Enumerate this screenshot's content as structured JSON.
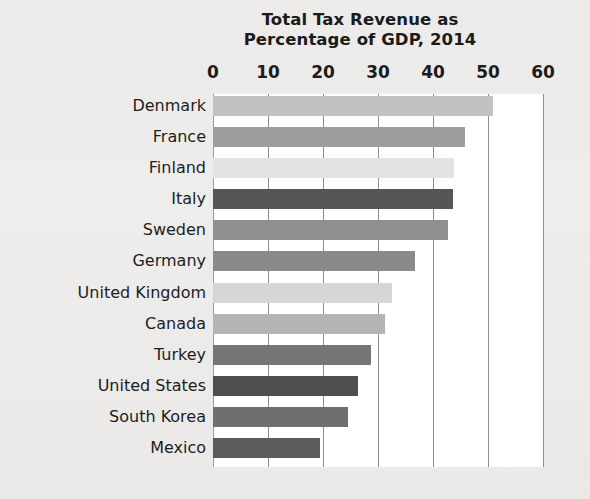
{
  "chart_data": {
    "type": "bar",
    "orientation": "horizontal",
    "title": "Total Tax Revenue as Percentage of GDP, 2014",
    "title_lines": [
      "Total Tax Revenue as",
      "Percentage of GDP, 2014"
    ],
    "xlabel": "",
    "ylabel": "",
    "xlim": [
      0,
      60
    ],
    "xticks": [
      0,
      10,
      20,
      30,
      40,
      50,
      60
    ],
    "xtick_labels": [
      "0",
      "10",
      "20",
      "30",
      "40",
      "50",
      "60"
    ],
    "grid": "vertical",
    "legend": "none",
    "units": "percent of GDP",
    "categories": [
      "Denmark",
      "France",
      "Finland",
      "Italy",
      "Sweden",
      "Germany",
      "United Kingdom",
      "Canada",
      "Turkey",
      "United States",
      "South Korea",
      "Mexico"
    ],
    "values": [
      50.9,
      45.8,
      43.9,
      43.6,
      42.7,
      36.7,
      32.6,
      31.2,
      28.7,
      26.4,
      24.6,
      19.5
    ],
    "bar_colors": [
      "#c2c2c2",
      "#9d9d9d",
      "#e3e3e3",
      "#565656",
      "#8f8f8f",
      "#8a8a8a",
      "#d6d6d6",
      "#b4b4b4",
      "#757575",
      "#4e4e4e",
      "#6f6f6f",
      "#5c5c5c"
    ],
    "bars": [
      {
        "label": "Denmark",
        "value": 50.9,
        "color": "#c2c2c2"
      },
      {
        "label": "France",
        "value": 45.8,
        "color": "#9d9d9d"
      },
      {
        "label": "Finland",
        "value": 43.9,
        "color": "#e3e3e3"
      },
      {
        "label": "Italy",
        "value": 43.6,
        "color": "#565656"
      },
      {
        "label": "Sweden",
        "value": 42.7,
        "color": "#8f8f8f"
      },
      {
        "label": "Germany",
        "value": 36.7,
        "color": "#8a8a8a"
      },
      {
        "label": "United Kingdom",
        "value": 32.6,
        "color": "#d6d6d6"
      },
      {
        "label": "Canada",
        "value": 31.2,
        "color": "#b4b4b4"
      },
      {
        "label": "Turkey",
        "value": 28.7,
        "color": "#757575"
      },
      {
        "label": "United States",
        "value": 26.4,
        "color": "#4e4e4e"
      },
      {
        "label": "South Korea",
        "value": 24.6,
        "color": "#6f6f6f"
      },
      {
        "label": "Mexico",
        "value": 19.5,
        "color": "#5c5c5c"
      }
    ]
  },
  "style": {
    "page_background": "#ececeb",
    "plot_background": "#ffffff",
    "gridline_color": "#8e8e8e",
    "text_color": "#1c1c1c"
  }
}
